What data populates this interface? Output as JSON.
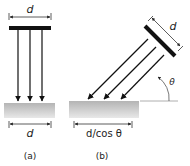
{
  "diagram": {
    "panel_a": {
      "caption": "(a)",
      "source_width_label": "d",
      "surface_width_label": "d",
      "ray_count": 3
    },
    "panel_b": {
      "caption": "(b)",
      "source_width_label": "d",
      "angle_label": "θ",
      "surface_width_label": "d/cos θ",
      "ray_count": 3
    },
    "colors": {
      "ink": "#111111",
      "surface_top": "#b9b9b9",
      "surface_bottom": "#e6e6e6"
    }
  }
}
